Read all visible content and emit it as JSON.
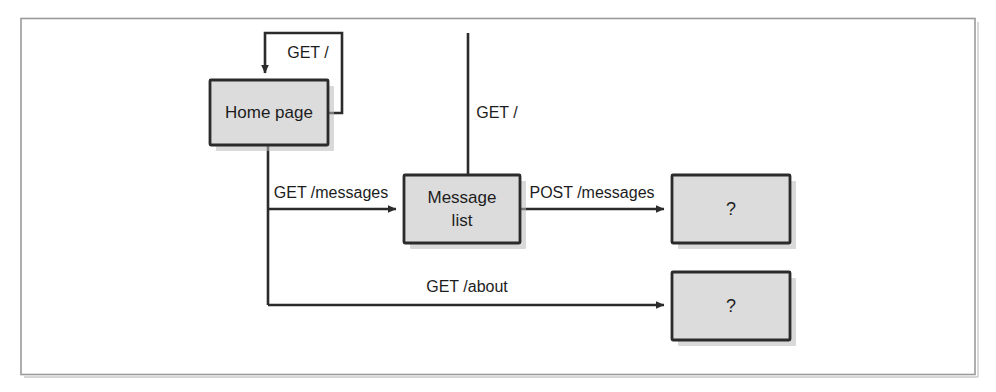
{
  "figure": {
    "kind": "state-transition-diagram",
    "frame": {
      "visible": true,
      "border_color": "#9a9a9a"
    }
  },
  "theme": {
    "node_fill": "#dcdcdc",
    "node_stroke": "#2b2b2b",
    "edge_stroke": "#2b2b2b",
    "text_color": "#1c1c1c",
    "page_background": "#ffffff",
    "shadow_color": "#b9b9b9"
  },
  "nodes": [
    {
      "id": "home",
      "label": "Home page",
      "label_lines": [
        "Home page"
      ]
    },
    {
      "id": "messages",
      "label": "Message list",
      "label_lines": [
        "Message",
        "list"
      ]
    },
    {
      "id": "unknown1",
      "label": "?",
      "label_lines": [
        "?"
      ]
    },
    {
      "id": "unknown2",
      "label": "?",
      "label_lines": [
        "?"
      ]
    }
  ],
  "edges": [
    {
      "id": "home-self",
      "from": "home",
      "to": "home",
      "label": "GET /"
    },
    {
      "id": "messages-to-home",
      "from": "messages",
      "to": "home",
      "label": "GET /"
    },
    {
      "id": "home-to-messages",
      "from": "home",
      "to": "messages",
      "label": "GET /messages"
    },
    {
      "id": "messages-to-unknown1",
      "from": "messages",
      "to": "unknown1",
      "label": "POST /messages"
    },
    {
      "id": "home-to-unknown2",
      "from": "home",
      "to": "unknown2",
      "label": "GET /about"
    }
  ],
  "labels": {
    "get_root_self": "GET /",
    "get_root_return": "GET /",
    "get_messages": "GET /messages",
    "post_messages": "POST /messages",
    "get_about": "GET /about",
    "home_page": "Home page",
    "message_line1": "Message",
    "message_line2": "list",
    "question_1": "?",
    "question_2": "?"
  }
}
